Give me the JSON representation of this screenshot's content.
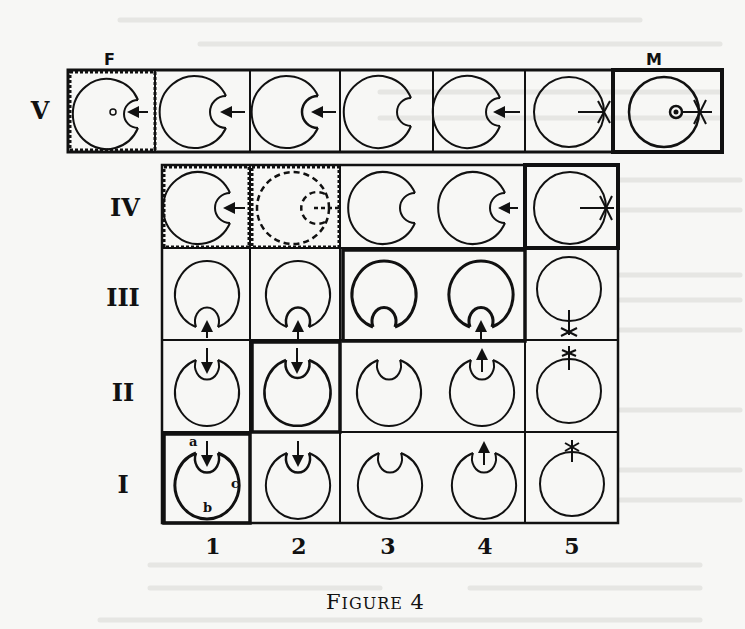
{
  "figure": {
    "caption_first": "F",
    "caption_rest": "IGURE",
    "caption_number": "4",
    "top_labels": {
      "F": "F",
      "M": "M"
    },
    "row_labels": [
      "V",
      "IV",
      "III",
      "II",
      "I"
    ],
    "column_labels": [
      "1",
      "2",
      "3",
      "4",
      "5"
    ],
    "cell_letters": {
      "a": "a",
      "b": "b",
      "c": "c"
    }
  },
  "rows": [
    {
      "label": "V",
      "cells": [
        "F: dashed border, pit with inner spot + arrow",
        "pit + arrow",
        "pit + arrow, bold lips",
        "closed pit",
        "pit + arrow",
        "arrow to star",
        "M: thick border, ring spot + star"
      ]
    },
    {
      "label": "IV",
      "cells": [
        "dashed border, pit + arrow",
        "dashed border, dashed circles",
        "closed pit",
        "pit + arrow",
        "thick border, star"
      ]
    },
    {
      "label": "III",
      "cells": [
        "pit + arrow up",
        "pit + arrow up, bold lips",
        "bold, closed pit",
        "bold, pit + arrow",
        "star bottom"
      ]
    },
    {
      "label": "II",
      "cells": [
        "arrow down into pit",
        "thick border, arrow + bold lips",
        "closed pit",
        "arrow up",
        "star top"
      ]
    },
    {
      "label": "I",
      "cells": [
        "thick border, labelled a b c",
        "arrow down, bold lips",
        "closed pit",
        "arrow up",
        "star top"
      ]
    }
  ]
}
